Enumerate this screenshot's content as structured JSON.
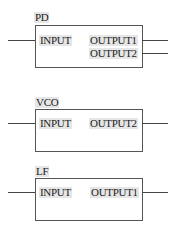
{
  "blocks": [
    {
      "name": "PD",
      "inputs": [
        "INPUT"
      ],
      "outputs": [
        "OUTPUT1",
        "OUTPUT2"
      ]
    },
    {
      "name": "VCO",
      "inputs": [
        "INPUT"
      ],
      "outputs": [
        "OUTPUT2"
      ]
    },
    {
      "name": "LF",
      "inputs": [
        "INPUT"
      ],
      "outputs": [
        "OUTPUT1"
      ]
    }
  ]
}
